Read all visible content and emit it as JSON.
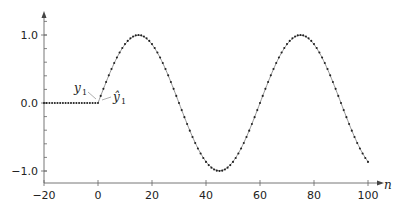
{
  "chart_data": {
    "type": "line",
    "title": "",
    "xlabel": "n",
    "ylabel": "",
    "xlim": [
      -20,
      100
    ],
    "ylim": [
      -1.2,
      1.25
    ],
    "x_ticks": [
      -20,
      0,
      20,
      40,
      60,
      80,
      100
    ],
    "x_tick_labels": [
      "−20",
      "0",
      "20",
      "40",
      "60",
      "80",
      "100"
    ],
    "y_ticks": [
      -1.0,
      0.0,
      1.0
    ],
    "y_tick_labels": [
      "−1.0",
      "0.0",
      "1.0"
    ],
    "y_minor_step": 0.2,
    "grid": false,
    "legend": null,
    "series": [
      {
        "name": "y",
        "style": "dots",
        "description": "0 for n<0, sin(2πn/60) for 0≤n≤100",
        "x_range": [
          -20,
          100
        ],
        "period": 60
      },
      {
        "name": "ŷ",
        "style": "thin line",
        "description": "estimate closely tracking y, starting at n=0",
        "x_range": [
          0,
          100
        ],
        "period": 60
      }
    ],
    "key_points": [
      {
        "n": 15,
        "y": 1.0
      },
      {
        "n": 45,
        "y": -1.0
      },
      {
        "n": 75,
        "y": 1.0
      },
      {
        "n": 100,
        "y": -0.87
      }
    ],
    "annotations": [
      {
        "text": "y",
        "subscript": "1"
      },
      {
        "text": "ŷ",
        "subscript": "1"
      }
    ]
  },
  "labels": {
    "xlabel": "n",
    "ann_y": "y",
    "ann_y_sub": "1",
    "ann_yhat": "ŷ",
    "ann_yhat_sub": "1"
  }
}
